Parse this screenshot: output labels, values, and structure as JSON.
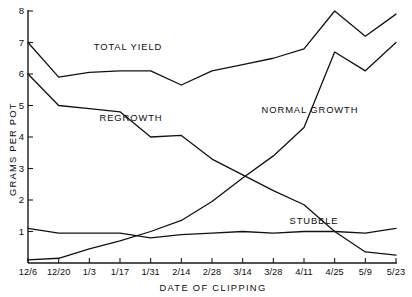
{
  "chart_data": {
    "type": "line",
    "title": "",
    "xlabel": "DATE OF CLIPPING",
    "ylabel": "GRAMS PER POT",
    "categories": [
      "12/6",
      "12/20",
      "1/3",
      "1/17",
      "1/31",
      "2/14",
      "2/28",
      "3/14",
      "3/28",
      "4/11",
      "4/25",
      "5/9",
      "5/23"
    ],
    "ylim": [
      0,
      8
    ],
    "yticks": [
      1,
      2,
      3,
      4,
      5,
      6,
      7,
      8
    ],
    "ytick_labels": [
      "1",
      "2",
      "3",
      "4",
      "5",
      "6",
      "7",
      "8"
    ],
    "grid": false,
    "legend": "inline-annotations",
    "series": [
      {
        "name": "TOTAL YIELD",
        "values": [
          7.0,
          5.9,
          6.05,
          6.1,
          6.1,
          5.65,
          6.1,
          6.3,
          6.5,
          6.8,
          8.0,
          7.2,
          7.9
        ]
      },
      {
        "name": "REGROWTH",
        "values": [
          6.0,
          5.0,
          4.9,
          4.8,
          4.0,
          4.05,
          3.3,
          2.8,
          2.3,
          1.85,
          1.0,
          0.35,
          0.25
        ]
      },
      {
        "name": "NORMAL GROWTH",
        "values": [
          0.1,
          0.15,
          0.45,
          0.7,
          1.0,
          1.35,
          1.95,
          2.7,
          3.4,
          4.3,
          6.7,
          6.1,
          7.0
        ]
      },
      {
        "name": "STUBBLE",
        "values": [
          1.1,
          0.95,
          0.95,
          0.95,
          0.8,
          0.9,
          0.95,
          1.0,
          0.95,
          1.0,
          1.0,
          0.95,
          1.1
        ]
      }
    ],
    "annotations": [
      {
        "text": "TOTAL YIELD",
        "x_px": 128,
        "y_px": 50
      },
      {
        "text": "REGROWTH",
        "x_px": 131,
        "y_px": 121
      },
      {
        "text": "NORMAL  GROWTH",
        "x_px": 310,
        "y_px": 113
      },
      {
        "text": "STUBBLE",
        "x_px": 314,
        "y_px": 224
      }
    ],
    "colors": {
      "line": "#111111",
      "axis": "#1a1a1a",
      "background": "#ffffff"
    }
  }
}
